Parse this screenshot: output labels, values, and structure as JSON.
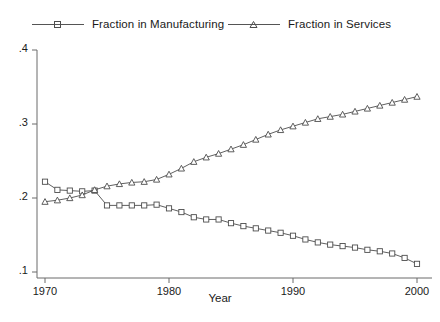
{
  "chart_data": {
    "type": "line",
    "title": "",
    "xlabel": "Year",
    "ylabel": "",
    "xlim": [
      1969,
      2001
    ],
    "ylim": [
      0.1,
      0.4
    ],
    "xticks": [
      1970,
      1980,
      1990,
      2000
    ],
    "xtick_labels": [
      "1970",
      "1980",
      "1990",
      "2000"
    ],
    "yticks": [
      0.1,
      0.2,
      0.3,
      0.4
    ],
    "ytick_labels": [
      ".1",
      ".2",
      ".3",
      ".4"
    ],
    "grid": false,
    "legend_position": "top",
    "x": [
      1970,
      1971,
      1972,
      1973,
      1974,
      1975,
      1976,
      1977,
      1978,
      1979,
      1980,
      1981,
      1982,
      1983,
      1984,
      1985,
      1986,
      1987,
      1988,
      1989,
      1990,
      1991,
      1992,
      1993,
      1994,
      1995,
      1996,
      1997,
      1998,
      1999,
      2000
    ],
    "series": [
      {
        "name": "Fraction in Manufacturing",
        "marker": "square",
        "color": "#4d4d4d",
        "values": [
          0.222,
          0.211,
          0.21,
          0.209,
          0.21,
          0.19,
          0.19,
          0.19,
          0.19,
          0.191,
          0.186,
          0.181,
          0.174,
          0.171,
          0.171,
          0.166,
          0.162,
          0.159,
          0.156,
          0.153,
          0.149,
          0.144,
          0.14,
          0.137,
          0.135,
          0.133,
          0.13,
          0.128,
          0.125,
          0.119,
          0.111
        ]
      },
      {
        "name": "Fraction in Services",
        "marker": "triangle",
        "color": "#4d4d4d",
        "values": [
          0.195,
          0.197,
          0.2,
          0.204,
          0.211,
          0.216,
          0.219,
          0.221,
          0.222,
          0.225,
          0.232,
          0.24,
          0.249,
          0.255,
          0.26,
          0.266,
          0.272,
          0.279,
          0.286,
          0.292,
          0.297,
          0.302,
          0.307,
          0.31,
          0.313,
          0.317,
          0.321,
          0.325,
          0.329,
          0.333,
          0.337
        ]
      }
    ]
  },
  "legend": {
    "entries": [
      {
        "label": "Fraction in Manufacturing",
        "marker": "square-marker-icon"
      },
      {
        "label": "Fraction in Services",
        "marker": "triangle-marker-icon"
      }
    ]
  },
  "axes": {
    "x_title": "Year",
    "y_title": ""
  }
}
